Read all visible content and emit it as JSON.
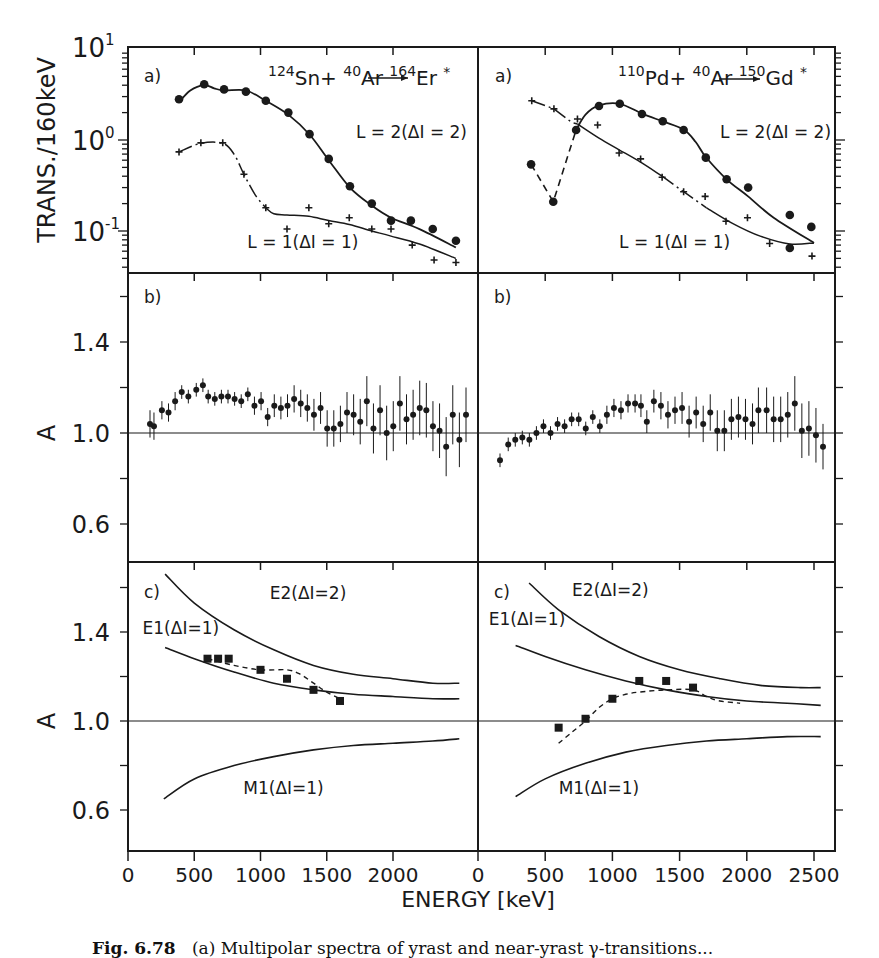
{
  "figure": {
    "caption_label": "Fig. 6.78",
    "caption_text": "(a) Multipolar spectra of yrast and near-yrast γ-transitions...",
    "x_axis_title": "ENERGY [keV]",
    "ink_color": "#1a1a1a",
    "background": "#ffffff"
  },
  "chart_data": [
    {
      "id": "left-a",
      "type": "line",
      "panel_label": "a)",
      "title": "124Sn + 40Ar → 164Er*",
      "reaction": {
        "target_mass": "124",
        "target": "Sn",
        "beam_mass": "40",
        "beam": "Ar",
        "product_mass": "164",
        "product": "Er",
        "suffix": "*"
      },
      "xlabel": "ENERGY [keV]",
      "ylabel": "TRANS./160keV",
      "yscale": "log",
      "ylim": [
        0.035,
        10
      ],
      "xlim": [
        0,
        2550
      ],
      "y_ticks": [
        "10^1",
        "10^0",
        "10^-1"
      ],
      "x_ticks": [
        0,
        500,
        1000,
        1500,
        2000
      ],
      "series": [
        {
          "name": "L=2(ΔI=2)",
          "marker": "dot",
          "line": "solid",
          "x": [
            385,
            575,
            725,
            890,
            1040,
            1210,
            1370,
            1515,
            1675,
            1840,
            1985,
            2135,
            2300,
            2475
          ],
          "y": [
            2.8,
            4.1,
            3.6,
            3.4,
            2.7,
            2.0,
            1.16,
            0.62,
            0.31,
            0.2,
            0.13,
            0.13,
            0.105,
            0.078
          ],
          "fit_x": [
            385,
            470,
            575,
            650,
            725,
            890,
            1040,
            1210,
            1370,
            1515,
            1675,
            1840,
            1985,
            2200,
            2475
          ],
          "fit_y": [
            2.6,
            3.5,
            4.0,
            3.7,
            3.5,
            3.5,
            2.7,
            1.9,
            1.15,
            0.6,
            0.3,
            0.19,
            0.14,
            0.105,
            0.066
          ]
        },
        {
          "name": "L=1(ΔI=1)",
          "marker": "cross",
          "line": "dash-dot then solid",
          "x": [
            385,
            550,
            715,
            875,
            1040,
            1200,
            1365,
            1515,
            1670,
            1840,
            1985,
            2145,
            2310,
            2475
          ],
          "y": [
            0.74,
            0.93,
            0.93,
            0.42,
            0.18,
            0.105,
            0.18,
            0.12,
            0.14,
            0.105,
            0.105,
            0.07,
            0.048,
            0.045
          ],
          "fit_x": [
            385,
            550,
            715,
            800,
            875,
            960,
            1040,
            1100,
            1200,
            1365,
            1515,
            1670,
            1840,
            1985,
            2200,
            2475
          ],
          "fit_y": [
            0.74,
            0.92,
            0.92,
            0.7,
            0.42,
            0.25,
            0.18,
            0.155,
            0.15,
            0.145,
            0.13,
            0.118,
            0.1,
            0.088,
            0.072,
            0.05
          ]
        }
      ],
      "annotations": [
        {
          "text": "L = 2(ΔI = 2)",
          "x": 1720,
          "y": 1.05
        },
        {
          "text": "L = 1(ΔI = 1)",
          "x": 900,
          "y": 0.065
        }
      ]
    },
    {
      "id": "right-a",
      "type": "line",
      "panel_label": "a)",
      "title": "110Pd + 40Ar → 150Gd*",
      "reaction": {
        "target_mass": "110",
        "target": "Pd",
        "beam_mass": "40",
        "beam": "Ar",
        "product_mass": "150",
        "product": "Gd",
        "suffix": "*"
      },
      "yscale": "log",
      "ylim": [
        0.035,
        10
      ],
      "xlim": [
        0,
        2650
      ],
      "x_ticks": [
        0,
        500,
        1000,
        1500,
        2000,
        2500
      ],
      "series": [
        {
          "name": "L=2(ΔI=2)",
          "marker": "dot",
          "line": "dashed then solid",
          "x": [
            395,
            560,
            730,
            900,
            1055,
            1220,
            1375,
            1530,
            1695,
            1850,
            2010,
            2320,
            2480,
            2320
          ],
          "y": [
            0.54,
            0.21,
            1.29,
            2.36,
            2.5,
            1.93,
            1.61,
            1.29,
            0.64,
            0.37,
            0.3,
            0.15,
            0.111,
            0.065
          ],
          "fit_x": [
            395,
            560,
            730,
            800,
            900,
            1055,
            1220,
            1375,
            1530,
            1620,
            1695,
            1850,
            2010,
            2200,
            2500
          ],
          "fit_y": [
            0.54,
            0.21,
            1.29,
            1.9,
            2.4,
            2.5,
            1.95,
            1.6,
            1.3,
            0.95,
            0.65,
            0.37,
            0.24,
            0.14,
            0.074
          ]
        },
        {
          "name": "L=1(ΔI=1)",
          "marker": "cross",
          "line": "dash-dot then solid",
          "x": [
            400,
            565,
            740,
            890,
            1050,
            1210,
            1370,
            1530,
            1690,
            1845,
            2005,
            2170,
            2485
          ],
          "y": [
            2.7,
            2.2,
            1.7,
            1.46,
            0.72,
            0.62,
            0.39,
            0.27,
            0.24,
            0.128,
            0.14,
            0.073,
            0.053
          ],
          "fit_x": [
            400,
            565,
            700,
            740,
            900,
            1050,
            1210,
            1370,
            1530,
            1700,
            1900,
            2100,
            2320,
            2500
          ],
          "fit_y": [
            2.7,
            2.2,
            1.55,
            1.5,
            1.05,
            0.78,
            0.57,
            0.4,
            0.27,
            0.18,
            0.12,
            0.088,
            0.072,
            0.074
          ]
        }
      ],
      "annotations": [
        {
          "text": "L = 2(ΔI = 2)",
          "x": 1800,
          "y": 1.05
        },
        {
          "text": "L = 1(ΔI = 1)",
          "x": 1050,
          "y": 0.065
        }
      ]
    },
    {
      "id": "left-b",
      "type": "scatter",
      "panel_label": "b)",
      "ylabel": "A",
      "ylim": [
        0.48,
        1.72
      ],
      "y_ticks": [
        0.6,
        1.0,
        1.4
      ],
      "reference_line": 1.0,
      "x": [
        260,
        290,
        350,
        400,
        450,
        500,
        550,
        610,
        660,
        700,
        750,
        800,
        850,
        900,
        950,
        1000,
        1050,
        1100,
        1150,
        1200,
        1250,
        1300,
        1350,
        1400,
        1450,
        1500,
        1550,
        1600,
        1650,
        1700,
        1750,
        1800,
        1850,
        1900,
        1950,
        2000,
        2050,
        2100,
        2150,
        2200,
        2250,
        2300,
        2350,
        2400,
        2450,
        2500
      ],
      "y": [
        1.04,
        1.03,
        1.1,
        1.09,
        1.14,
        1.18,
        1.16,
        1.19,
        1.21,
        1.16,
        1.15,
        1.16,
        1.16,
        1.15,
        1.14,
        1.17,
        1.12,
        1.14,
        1.07,
        1.12,
        1.11,
        1.12,
        1.15,
        1.13,
        1.11,
        1.08,
        1.11,
        1.02,
        1.02,
        1.04,
        1.09,
        1.08,
        1.05,
        1.14,
        1.02,
        1.1,
        1.0,
        1.03,
        1.13,
        1.06,
        1.08,
        1.11,
        1.1,
        1.03,
        1.01,
        0.94
      ],
      "err": [
        0.06,
        0.06,
        0.04,
        0.04,
        0.04,
        0.03,
        0.03,
        0.03,
        0.03,
        0.03,
        0.03,
        0.03,
        0.03,
        0.03,
        0.03,
        0.03,
        0.04,
        0.04,
        0.04,
        0.05,
        0.05,
        0.05,
        0.06,
        0.06,
        0.06,
        0.07,
        0.07,
        0.08,
        0.08,
        0.08,
        0.09,
        0.09,
        0.1,
        0.11,
        0.11,
        0.11,
        0.12,
        0.11,
        0.12,
        0.11,
        0.11,
        0.12,
        0.12,
        0.11,
        0.12,
        0.13
      ],
      "extra_points": {
        "x": [
          2550,
          2600,
          2650
        ],
        "y": [
          1.08,
          0.97,
          1.08
        ],
        "err": [
          0.13,
          0.12,
          0.12
        ]
      }
    },
    {
      "id": "right-b",
      "type": "scatter",
      "panel_label": "b)",
      "ylim": [
        0.48,
        1.72
      ],
      "reference_line": 1.0,
      "x": [
        250,
        320,
        380,
        440,
        500,
        560,
        620,
        680,
        740,
        800,
        860,
        920,
        980,
        1040,
        1100,
        1160,
        1220,
        1280,
        1340,
        1400,
        1450,
        1500,
        1560,
        1620,
        1680,
        1740,
        1800,
        1860,
        1920,
        1980,
        2040,
        2100,
        2160,
        2220,
        2280,
        2340,
        2400,
        2450,
        2520,
        2580,
        2640,
        2700,
        2760,
        2820,
        2880,
        2940,
        3000
      ],
      "y": [
        0.88,
        0.95,
        0.97,
        0.98,
        0.97,
        1.0,
        1.03,
        1.0,
        1.04,
        1.03,
        1.06,
        1.06,
        1.02,
        1.07,
        1.03,
        1.08,
        1.11,
        1.1,
        1.13,
        1.13,
        1.12,
        1.05,
        1.14,
        1.12,
        1.08,
        1.1,
        1.11,
        1.05,
        1.09,
        1.04,
        1.09,
        1.01,
        1.01,
        1.06,
        1.07,
        1.06,
        1.04,
        1.1,
        1.1,
        1.06,
        1.06,
        1.08,
        1.13,
        1.01,
        1.02,
        0.99,
        0.94
      ],
      "err": [
        0.03,
        0.03,
        0.03,
        0.03,
        0.03,
        0.03,
        0.03,
        0.03,
        0.03,
        0.03,
        0.03,
        0.03,
        0.03,
        0.03,
        0.03,
        0.04,
        0.04,
        0.04,
        0.04,
        0.04,
        0.05,
        0.05,
        0.05,
        0.06,
        0.06,
        0.06,
        0.07,
        0.07,
        0.07,
        0.08,
        0.08,
        0.09,
        0.09,
        0.09,
        0.09,
        0.09,
        0.09,
        0.1,
        0.1,
        0.1,
        0.1,
        0.1,
        0.12,
        0.12,
        0.12,
        0.12,
        0.1
      ],
      "extra_points": {
        "x": [],
        "y": [],
        "err": []
      }
    },
    {
      "id": "left-c",
      "type": "line",
      "panel_label": "c)",
      "ylabel": "A",
      "ylim": [
        0.48,
        1.72
      ],
      "y_ticks": [
        0.6,
        1.0,
        1.4
      ],
      "reference_line": 1.0,
      "curves": [
        {
          "name": "E2(ΔI=2)",
          "x": [
            280,
            500,
            800,
            1100,
            1400,
            1700,
            2000,
            2300,
            2500
          ],
          "y": [
            1.66,
            1.53,
            1.41,
            1.32,
            1.25,
            1.21,
            1.19,
            1.17,
            1.17
          ]
        },
        {
          "name": "E1(ΔI=1)",
          "x": [
            280,
            500,
            800,
            1100,
            1400,
            1700,
            2000,
            2300,
            2500
          ],
          "y": [
            1.33,
            1.28,
            1.22,
            1.17,
            1.14,
            1.12,
            1.11,
            1.1,
            1.1
          ]
        },
        {
          "name": "M1(ΔI=1)",
          "x": [
            270,
            500,
            800,
            1100,
            1400,
            1700,
            2000,
            2300,
            2500
          ],
          "y": [
            0.65,
            0.74,
            0.8,
            0.84,
            0.87,
            0.89,
            0.9,
            0.91,
            0.92
          ]
        }
      ],
      "points": {
        "x": [
          600,
          680,
          760,
          1000,
          1200,
          1400,
          1600
        ],
        "y": [
          1.28,
          1.28,
          1.28,
          1.23,
          1.19,
          1.14,
          1.09
        ]
      },
      "fit_dashed": {
        "x": [
          600,
          800,
          1000,
          1200,
          1300,
          1400,
          1500,
          1600
        ],
        "y": [
          1.28,
          1.25,
          1.23,
          1.23,
          1.21,
          1.17,
          1.13,
          1.1
        ]
      },
      "annotations": [
        {
          "text": "E2(ΔI=2)",
          "x": 1070,
          "y": 1.55
        },
        {
          "text": "E1(ΔI=1)",
          "x": 110,
          "y": 1.39
        },
        {
          "text": "M1(ΔI=1)",
          "x": 870,
          "y": 0.67
        }
      ]
    },
    {
      "id": "right-c",
      "type": "line",
      "panel_label": "c)",
      "ylim": [
        0.48,
        1.72
      ],
      "reference_line": 1.0,
      "curves": [
        {
          "name": "E2(ΔI=2)",
          "x": [
            380,
            600,
            900,
            1200,
            1500,
            1800,
            2100,
            2400,
            2550
          ],
          "y": [
            1.62,
            1.5,
            1.38,
            1.29,
            1.23,
            1.19,
            1.16,
            1.15,
            1.15
          ]
        },
        {
          "name": "E1(ΔI=1)",
          "x": [
            280,
            500,
            800,
            1100,
            1400,
            1700,
            2000,
            2300,
            2550
          ],
          "y": [
            1.34,
            1.29,
            1.23,
            1.18,
            1.14,
            1.11,
            1.09,
            1.08,
            1.07
          ]
        },
        {
          "name": "M1(ΔI=1)",
          "x": [
            280,
            500,
            800,
            1100,
            1400,
            1700,
            2000,
            2300,
            2550
          ],
          "y": [
            0.66,
            0.74,
            0.81,
            0.86,
            0.89,
            0.91,
            0.92,
            0.93,
            0.93
          ]
        }
      ],
      "points": {
        "x": [
          600,
          800,
          1000,
          1200,
          1400,
          1600
        ],
        "y": [
          0.97,
          1.01,
          1.1,
          1.18,
          1.18,
          1.15
        ]
      },
      "fit_dashed": {
        "x": [
          600,
          700,
          800,
          900,
          1000,
          1100,
          1200,
          1400,
          1600,
          1700,
          1800,
          1950
        ],
        "y": [
          0.9,
          0.95,
          1.0,
          1.06,
          1.1,
          1.12,
          1.13,
          1.14,
          1.14,
          1.11,
          1.09,
          1.08
        ]
      },
      "annotations": [
        {
          "text": "E2(ΔI=2)",
          "x": 700,
          "y": 1.56
        },
        {
          "text": "E1(ΔI=1)",
          "x": 80,
          "y": 1.43
        },
        {
          "text": "M1(ΔI=1)",
          "x": 600,
          "y": 0.67
        }
      ]
    }
  ],
  "axes": {
    "left_x_tick_labels": [
      "0",
      "500",
      "1000",
      "1500",
      "2000"
    ],
    "right_x_tick_labels": [
      "0",
      "500",
      "1000",
      "1500",
      "2000",
      "2500"
    ],
    "a_y_tick_labels": [
      {
        "base": "10",
        "exp": "1"
      },
      {
        "base": "10",
        "exp": "0"
      },
      {
        "base": "10",
        "exp": "-1"
      }
    ],
    "ab_y_tick_labels": [
      "1.4",
      "1.0",
      "0.6"
    ],
    "a_ylabel": "TRANS./160keV",
    "b_ylabel": "A",
    "c_ylabel": "A"
  }
}
